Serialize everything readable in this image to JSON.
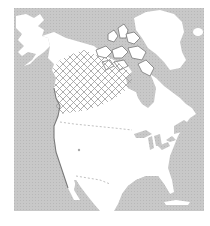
{
  "map": {
    "title": "",
    "region": "North America",
    "range_label": "Range (cross-hatched)",
    "colors": {
      "ocean": "#c8c8c8",
      "land": "#ffffff",
      "coast": "#8a8a8a",
      "hatch": "#9a9a9a",
      "border_dash": "#b0b0b0",
      "background": "#ffffff"
    },
    "features": [
      "alaska",
      "canada",
      "canadian-arctic-archipelago",
      "greenland",
      "iceland",
      "hudson-bay",
      "great-lakes",
      "united-states",
      "mexico",
      "gulf-of-mexico",
      "cuba",
      "us-canada-border",
      "range-area"
    ]
  }
}
